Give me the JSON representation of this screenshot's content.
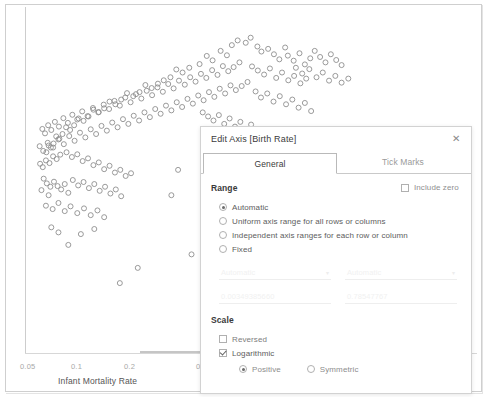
{
  "chart_data": {
    "type": "scatter",
    "title": "",
    "xlabel": "Infant Mortality Rate",
    "ylabel": "Birth Rate",
    "xticks": [
      "0.05",
      "0.1",
      "0.2",
      "0.5"
    ],
    "xtick_positions": [
      0.105,
      0.258,
      0.41,
      0.628
    ],
    "xscale": "log",
    "grid": false,
    "legend": "none",
    "marker": {
      "shape": "open-circle",
      "color": "#8f8f8f",
      "size": 5
    },
    "points": [
      [
        0.455,
        0.101
      ],
      [
        0.468,
        0.087
      ],
      [
        0.486,
        0.094
      ],
      [
        0.497,
        0.079
      ],
      [
        0.512,
        0.105
      ],
      [
        0.43,
        0.118
      ],
      [
        0.444,
        0.131
      ],
      [
        0.412,
        0.146
      ],
      [
        0.399,
        0.133
      ],
      [
        0.383,
        0.157
      ],
      [
        0.521,
        0.12
      ],
      [
        0.536,
        0.112
      ],
      [
        0.549,
        0.128
      ],
      [
        0.561,
        0.143
      ],
      [
        0.574,
        0.108
      ],
      [
        0.36,
        0.168
      ],
      [
        0.345,
        0.182
      ],
      [
        0.331,
        0.173
      ],
      [
        0.318,
        0.196
      ],
      [
        0.303,
        0.205
      ],
      [
        0.29,
        0.215
      ],
      [
        0.276,
        0.228
      ],
      [
        0.262,
        0.219
      ],
      [
        0.249,
        0.24
      ],
      [
        0.235,
        0.252
      ],
      [
        0.221,
        0.243
      ],
      [
        0.208,
        0.262
      ],
      [
        0.195,
        0.276
      ],
      [
        0.182,
        0.268
      ],
      [
        0.17,
        0.288
      ],
      [
        0.158,
        0.299
      ],
      [
        0.146,
        0.292
      ],
      [
        0.135,
        0.312
      ],
      [
        0.124,
        0.325
      ],
      [
        0.113,
        0.318
      ],
      [
        0.103,
        0.338
      ],
      [
        0.094,
        0.352
      ],
      [
        0.085,
        0.344
      ],
      [
        0.077,
        0.364
      ],
      [
        0.07,
        0.378
      ],
      [
        0.063,
        0.371
      ],
      [
        0.057,
        0.392
      ],
      [
        0.051,
        0.404
      ],
      [
        0.046,
        0.398
      ],
      [
        0.041,
        0.418
      ],
      [
        0.58,
        0.132
      ],
      [
        0.593,
        0.147
      ],
      [
        0.606,
        0.125
      ],
      [
        0.618,
        0.158
      ],
      [
        0.63,
        0.14
      ],
      [
        0.472,
        0.152
      ],
      [
        0.459,
        0.166
      ],
      [
        0.447,
        0.178
      ],
      [
        0.435,
        0.163
      ],
      [
        0.423,
        0.189
      ],
      [
        0.411,
        0.175
      ],
      [
        0.398,
        0.198
      ],
      [
        0.386,
        0.186
      ],
      [
        0.374,
        0.209
      ],
      [
        0.362,
        0.196
      ],
      [
        0.35,
        0.218
      ],
      [
        0.337,
        0.206
      ],
      [
        0.325,
        0.229
      ],
      [
        0.313,
        0.216
      ],
      [
        0.301,
        0.239
      ],
      [
        0.289,
        0.226
      ],
      [
        0.277,
        0.249
      ],
      [
        0.265,
        0.236
      ],
      [
        0.253,
        0.259
      ],
      [
        0.241,
        0.246
      ],
      [
        0.229,
        0.27
      ],
      [
        0.217,
        0.256
      ],
      [
        0.205,
        0.28
      ],
      [
        0.193,
        0.266
      ],
      [
        0.181,
        0.29
      ],
      [
        0.169,
        0.277
      ],
      [
        0.157,
        0.3
      ],
      [
        0.145,
        0.287
      ],
      [
        0.133,
        0.311
      ],
      [
        0.121,
        0.297
      ],
      [
        0.11,
        0.321
      ],
      [
        0.099,
        0.307
      ],
      [
        0.089,
        0.331
      ],
      [
        0.079,
        0.317
      ],
      [
        0.069,
        0.342
      ],
      [
        0.06,
        0.328
      ],
      [
        0.052,
        0.352
      ],
      [
        0.045,
        0.338
      ],
      [
        0.038,
        0.362
      ],
      [
        0.032,
        0.349
      ],
      [
        0.5,
        0.164
      ],
      [
        0.513,
        0.176
      ],
      [
        0.527,
        0.188
      ],
      [
        0.54,
        0.17
      ],
      [
        0.554,
        0.198
      ],
      [
        0.567,
        0.182
      ],
      [
        0.581,
        0.205
      ],
      [
        0.594,
        0.192
      ],
      [
        0.608,
        0.214
      ],
      [
        0.621,
        0.2
      ],
      [
        0.49,
        0.21
      ],
      [
        0.477,
        0.222
      ],
      [
        0.464,
        0.234
      ],
      [
        0.452,
        0.22
      ],
      [
        0.44,
        0.244
      ],
      [
        0.428,
        0.23
      ],
      [
        0.416,
        0.254
      ],
      [
        0.404,
        0.24
      ],
      [
        0.392,
        0.264
      ],
      [
        0.38,
        0.25
      ],
      [
        0.368,
        0.274
      ],
      [
        0.356,
        0.26
      ],
      [
        0.344,
        0.284
      ],
      [
        0.332,
        0.27
      ],
      [
        0.32,
        0.294
      ],
      [
        0.308,
        0.28
      ],
      [
        0.296,
        0.304
      ],
      [
        0.284,
        0.29
      ],
      [
        0.272,
        0.314
      ],
      [
        0.26,
        0.3
      ],
      [
        0.248,
        0.324
      ],
      [
        0.236,
        0.31
      ],
      [
        0.224,
        0.334
      ],
      [
        0.212,
        0.32
      ],
      [
        0.2,
        0.344
      ],
      [
        0.188,
        0.33
      ],
      [
        0.176,
        0.354
      ],
      [
        0.164,
        0.34
      ],
      [
        0.152,
        0.364
      ],
      [
        0.14,
        0.35
      ],
      [
        0.128,
        0.374
      ],
      [
        0.116,
        0.36
      ],
      [
        0.104,
        0.384
      ],
      [
        0.092,
        0.37
      ],
      [
        0.08,
        0.394
      ],
      [
        0.068,
        0.38
      ],
      [
        0.056,
        0.404
      ],
      [
        0.044,
        0.39
      ],
      [
        0.034,
        0.414
      ],
      [
        0.026,
        0.4
      ],
      [
        0.39,
        0.3
      ],
      [
        0.402,
        0.312
      ],
      [
        0.414,
        0.324
      ],
      [
        0.426,
        0.308
      ],
      [
        0.438,
        0.334
      ],
      [
        0.45,
        0.318
      ],
      [
        0.462,
        0.342
      ],
      [
        0.474,
        0.328
      ],
      [
        0.486,
        0.352
      ],
      [
        0.498,
        0.336
      ],
      [
        0.072,
        0.425
      ],
      [
        0.064,
        0.438
      ],
      [
        0.056,
        0.43
      ],
      [
        0.048,
        0.45
      ],
      [
        0.04,
        0.442
      ],
      [
        0.033,
        0.462
      ],
      [
        0.027,
        0.452
      ],
      [
        0.086,
        0.418
      ],
      [
        0.098,
        0.432
      ],
      [
        0.11,
        0.424
      ],
      [
        0.122,
        0.444
      ],
      [
        0.134,
        0.436
      ],
      [
        0.146,
        0.456
      ],
      [
        0.158,
        0.448
      ],
      [
        0.17,
        0.468
      ],
      [
        0.182,
        0.458
      ],
      [
        0.194,
        0.478
      ],
      [
        0.206,
        0.47
      ],
      [
        0.218,
        0.488
      ],
      [
        0.23,
        0.48
      ],
      [
        0.035,
        0.496
      ],
      [
        0.042,
        0.51
      ],
      [
        0.05,
        0.52
      ],
      [
        0.03,
        0.53
      ],
      [
        0.046,
        0.545
      ],
      [
        0.058,
        0.505
      ],
      [
        0.066,
        0.518
      ],
      [
        0.074,
        0.528
      ],
      [
        0.082,
        0.512
      ],
      [
        0.09,
        0.538
      ],
      [
        0.1,
        0.5
      ],
      [
        0.112,
        0.516
      ],
      [
        0.124,
        0.506
      ],
      [
        0.136,
        0.524
      ],
      [
        0.148,
        0.512
      ],
      [
        0.16,
        0.532
      ],
      [
        0.172,
        0.52
      ],
      [
        0.184,
        0.54
      ],
      [
        0.196,
        0.528
      ],
      [
        0.208,
        0.548
      ],
      [
        0.04,
        0.576
      ],
      [
        0.055,
        0.586
      ],
      [
        0.068,
        0.568
      ],
      [
        0.082,
        0.592
      ],
      [
        0.095,
        0.578
      ],
      [
        0.11,
        0.598
      ],
      [
        0.125,
        0.584
      ],
      [
        0.14,
        0.604
      ],
      [
        0.155,
        0.59
      ],
      [
        0.17,
        0.61
      ],
      [
        0.052,
        0.64
      ],
      [
        0.068,
        0.655
      ],
      [
        0.32,
        0.545
      ],
      [
        0.335,
        0.47
      ],
      [
        0.365,
        0.72
      ],
      [
        0.245,
        0.76
      ],
      [
        0.205,
        0.805
      ],
      [
        0.09,
        0.692
      ],
      [
        0.118,
        0.66
      ],
      [
        0.148,
        0.645
      ],
      [
        0.64,
        0.118
      ],
      [
        0.652,
        0.136
      ],
      [
        0.664,
        0.152
      ],
      [
        0.598,
        0.168
      ],
      [
        0.612,
        0.185
      ],
      [
        0.628,
        0.172
      ],
      [
        0.644,
        0.196
      ],
      [
        0.658,
        0.182
      ],
      [
        0.672,
        0.206
      ],
      [
        0.686,
        0.192
      ],
      [
        0.7,
        0.212
      ],
      [
        0.715,
        0.2
      ],
      [
        0.7,
        0.16
      ],
      [
        0.688,
        0.145
      ],
      [
        0.676,
        0.128
      ],
      [
        0.508,
        0.238
      ],
      [
        0.52,
        0.256
      ],
      [
        0.534,
        0.244
      ],
      [
        0.548,
        0.268
      ],
      [
        0.562,
        0.252
      ],
      [
        0.576,
        0.276
      ],
      [
        0.59,
        0.262
      ],
      [
        0.604,
        0.286
      ],
      [
        0.618,
        0.272
      ],
      [
        0.632,
        0.296
      ]
    ]
  },
  "annotations": [
    {
      "name": "arrow-to-include-zero",
      "target": "include-zero-checkbox"
    },
    {
      "name": "arrow-to-logarithmic",
      "target": "logarithmic-checkbox"
    }
  ],
  "dialog": {
    "title": "Edit Axis [Birth Rate]",
    "close_label": "✕",
    "tabs": [
      {
        "label": "General",
        "active": true
      },
      {
        "label": "Tick Marks",
        "active": false
      }
    ],
    "range": {
      "section_label": "Range",
      "options": [
        {
          "label": "Automatic",
          "selected": true
        },
        {
          "label": "Uniform axis range for all rows or columns",
          "selected": false
        },
        {
          "label": "Independent axis ranges for each row or column",
          "selected": false
        },
        {
          "label": "Fixed",
          "selected": false
        }
      ],
      "include_zero": {
        "label": "Include zero",
        "checked": false
      },
      "fields": {
        "start_select": "Automatic",
        "end_select": "Automatic",
        "start_value": "0.00349385660",
        "end_value": "0.78547767",
        "caret": "▾"
      }
    },
    "scale": {
      "section_label": "Scale",
      "reversed": {
        "label": "Reversed",
        "checked": false
      },
      "logarithmic": {
        "label": "Logarithmic",
        "checked": true
      },
      "log_mode": [
        {
          "label": "Positive",
          "selected": true
        },
        {
          "label": "Symmetric",
          "selected": false
        }
      ]
    }
  }
}
